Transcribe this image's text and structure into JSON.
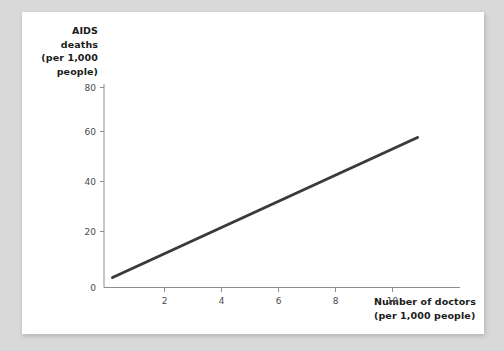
{
  "chart_data": {
    "type": "line",
    "title": "",
    "subtitle": "",
    "ylabel_lines": [
      "AIDS",
      "deaths",
      "(per 1,000",
      "people)"
    ],
    "xlabel_lines": [
      "Number of doctors",
      "(per 1,000 people)"
    ],
    "xlabel": "Number of doctors (per 1,000 people)",
    "ylabel": "AIDS deaths (per 1,000 people)",
    "xticks": [
      0,
      2,
      4,
      6,
      8,
      10
    ],
    "yticks": [
      0,
      20,
      40,
      60,
      80
    ],
    "xtick_labels": [
      "0",
      "2",
      "4",
      "6",
      "8",
      "10"
    ],
    "ytick_labels": [
      "0",
      "20",
      "40",
      "60",
      "80"
    ],
    "xlim": [
      0,
      12.5
    ],
    "ylim": [
      0,
      88
    ],
    "grid": false,
    "legend": null,
    "series": [
      {
        "name": "trend",
        "color": "#3a3a3a",
        "linewidth": 3,
        "x": [
          0.3,
          11.0
        ],
        "y": [
          4.0,
          60.0
        ]
      }
    ],
    "annotations": []
  },
  "figure": {
    "background_color": "#d9d9d9",
    "card_color": "#ffffff",
    "axis_color": "#8d8d8d",
    "tick_label_color": "#4a4a4a",
    "label_color": "#1b1b1b"
  }
}
